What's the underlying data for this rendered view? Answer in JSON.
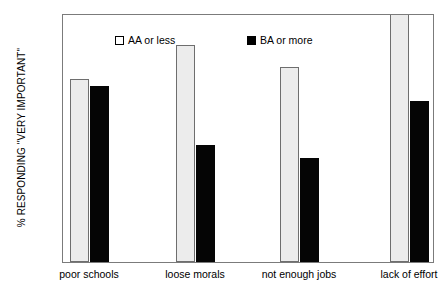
{
  "chart_data": {
    "type": "bar",
    "title": "",
    "xlabel": "",
    "ylabel": "% RESPONDING \"VERY IMPORTANT\"",
    "ylim": [
      0,
      50
    ],
    "ytick_step": 5,
    "yticks": [
      "0",
      "5",
      "10",
      "15",
      "20",
      "25",
      "30",
      "35",
      "40",
      "45",
      "50"
    ],
    "grid": false,
    "legend_position": "top-inside",
    "categories": [
      "poor schools",
      "loose morals",
      "not enough jobs",
      "lack of effort"
    ],
    "series": [
      {
        "name": "AA or less",
        "color": "#ececec",
        "values": [
          36.7,
          43.6,
          39.2,
          52.0
        ],
        "notes": "fourth bar is clipped by the 50 ceiling of the plot area"
      },
      {
        "name": "BA or more",
        "color": "#000000",
        "values": [
          35.3,
          23.5,
          20.9,
          32.3
        ]
      }
    ]
  },
  "legend": {
    "items": [
      {
        "label": "AA or less",
        "swatch": "light-square-icon"
      },
      {
        "label": "BA or more",
        "swatch": "dark-square-icon"
      }
    ]
  }
}
